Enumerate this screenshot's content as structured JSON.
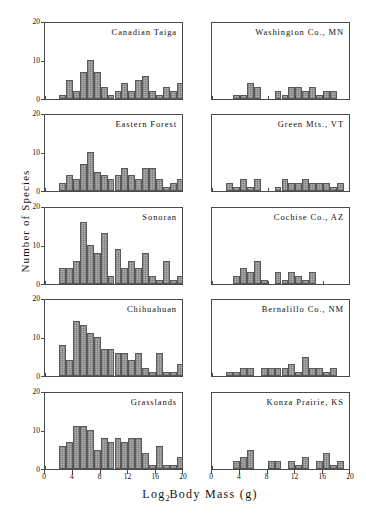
{
  "figure": {
    "xlabel_main": "Log",
    "xlabel_sub": "2",
    "xlabel_rest": "Body Mass (g)",
    "ylabel": "Number of Species",
    "xticks": [
      "0",
      "4",
      "8",
      "12",
      "16",
      "20"
    ],
    "yticks": [
      "0",
      "10",
      "20"
    ],
    "bar_fill": "#b3b3b3",
    "bar_edge": "#5a5a5a",
    "axis_color": "#4a4a4a"
  },
  "chart_data": [
    {
      "type": "bar",
      "title": "Canadian Taiga",
      "xlabel": "Log2 Body Mass (g)",
      "ylabel": "Number of Species",
      "xlim": [
        0,
        20
      ],
      "ylim": [
        0,
        20
      ],
      "grid": false,
      "bin_width": 1,
      "bin_starts": [
        2,
        3,
        4,
        5,
        6,
        7,
        8,
        9,
        10,
        11,
        12,
        13,
        14,
        15,
        16,
        17,
        18,
        19
      ],
      "values": [
        1,
        5,
        2,
        7,
        10,
        7,
        3,
        1,
        2,
        4,
        2,
        5,
        6,
        2,
        1,
        3,
        2,
        4
      ]
    },
    {
      "type": "bar",
      "title": "Washington Co., MN",
      "xlabel": "Log2 Body Mass (g)",
      "ylabel": "Number of Species",
      "xlim": [
        0,
        20
      ],
      "ylim": [
        0,
        20
      ],
      "grid": false,
      "bin_width": 1,
      "bin_starts": [
        3,
        4,
        5,
        6,
        9,
        10,
        11,
        12,
        13,
        14,
        15,
        16,
        17
      ],
      "values": [
        1,
        1,
        4,
        3,
        2,
        1,
        3,
        3,
        2,
        3,
        1,
        2,
        2
      ]
    },
    {
      "type": "bar",
      "title": "Eastern Forest",
      "xlabel": "Log2 Body Mass (g)",
      "ylabel": "Number of Species",
      "xlim": [
        0,
        20
      ],
      "ylim": [
        0,
        20
      ],
      "grid": false,
      "bin_width": 1,
      "bin_starts": [
        2,
        3,
        4,
        5,
        6,
        7,
        8,
        9,
        10,
        11,
        12,
        13,
        14,
        15,
        16,
        17,
        18,
        19
      ],
      "values": [
        2,
        4,
        3,
        7,
        10,
        5,
        4,
        3,
        4,
        6,
        4,
        3,
        6,
        6,
        3,
        1,
        2,
        3
      ]
    },
    {
      "type": "bar",
      "title": "Green Mts., VT",
      "xlabel": "Log2 Body Mass (g)",
      "ylabel": "Number of Species",
      "xlim": [
        0,
        20
      ],
      "ylim": [
        0,
        20
      ],
      "grid": false,
      "bin_width": 1,
      "bin_starts": [
        2,
        3,
        4,
        5,
        6,
        9,
        10,
        11,
        12,
        13,
        14,
        15,
        16,
        17,
        18
      ],
      "values": [
        2,
        1,
        3,
        1,
        3,
        1,
        3,
        2,
        2,
        3,
        2,
        2,
        2,
        1,
        2
      ]
    },
    {
      "type": "bar",
      "title": "Sonoran",
      "xlabel": "Log2 Body Mass (g)",
      "ylabel": "Number of Species",
      "xlim": [
        0,
        20
      ],
      "ylim": [
        0,
        20
      ],
      "grid": false,
      "bin_width": 1,
      "bin_starts": [
        2,
        3,
        4,
        5,
        6,
        7,
        8,
        9,
        10,
        11,
        12,
        13,
        14,
        15,
        16,
        17,
        18,
        19
      ],
      "values": [
        4,
        4,
        6,
        16,
        10,
        8,
        13,
        2,
        9,
        4,
        6,
        4,
        8,
        2,
        1,
        6,
        1,
        2
      ]
    },
    {
      "type": "bar",
      "title": "Cochise Co., AZ",
      "xlabel": "Log2 Body Mass (g)",
      "ylabel": "Number of Species",
      "xlim": [
        0,
        20
      ],
      "ylim": [
        0,
        20
      ],
      "grid": false,
      "bin_width": 1,
      "bin_starts": [
        3,
        4,
        5,
        6,
        7,
        9,
        10,
        11,
        12,
        13,
        14
      ],
      "values": [
        2,
        4,
        3,
        6,
        1,
        3,
        1,
        3,
        2,
        1,
        3
      ]
    },
    {
      "type": "bar",
      "title": "Chihuahuan",
      "xlabel": "Log2 Body Mass (g)",
      "ylabel": "Number of Species",
      "xlim": [
        0,
        20
      ],
      "ylim": [
        0,
        20
      ],
      "grid": false,
      "bin_width": 1,
      "bin_starts": [
        2,
        3,
        4,
        5,
        6,
        7,
        8,
        9,
        10,
        11,
        12,
        13,
        14,
        15,
        16,
        17,
        18,
        19
      ],
      "values": [
        8,
        4,
        14,
        13,
        11,
        10,
        7,
        7,
        6,
        6,
        4,
        6,
        2,
        1,
        6,
        1,
        1,
        3
      ]
    },
    {
      "type": "bar",
      "title": "Bernalillo Co., NM",
      "xlabel": "Log2 Body Mass (g)",
      "ylabel": "Number of Species",
      "xlim": [
        0,
        20
      ],
      "ylim": [
        0,
        20
      ],
      "grid": false,
      "bin_width": 1,
      "bin_starts": [
        2,
        3,
        4,
        5,
        7,
        8,
        9,
        10,
        11,
        12,
        13,
        14,
        15,
        16,
        17
      ],
      "values": [
        1,
        1,
        2,
        2,
        2,
        2,
        2,
        2,
        3,
        1,
        5,
        2,
        2,
        1,
        2
      ]
    },
    {
      "type": "bar",
      "title": "Grasslands",
      "xlabel": "Log2 Body Mass (g)",
      "ylabel": "Number of Species",
      "xlim": [
        0,
        20
      ],
      "ylim": [
        0,
        20
      ],
      "grid": false,
      "bin_width": 1,
      "bin_starts": [
        2,
        3,
        4,
        5,
        6,
        7,
        8,
        9,
        10,
        11,
        12,
        13,
        14,
        15,
        16,
        17,
        18,
        19
      ],
      "values": [
        6,
        7,
        11,
        11,
        10,
        5,
        8,
        7,
        8,
        7,
        8,
        8,
        4,
        1,
        6,
        1,
        1,
        3
      ]
    },
    {
      "type": "bar",
      "title": "Konza Prairie, KS",
      "xlabel": "Log2 Body Mass (g)",
      "ylabel": "Number of Species",
      "xlim": [
        0,
        20
      ],
      "ylim": [
        0,
        20
      ],
      "grid": false,
      "bin_width": 1,
      "bin_starts": [
        3,
        4,
        5,
        8,
        9,
        11,
        12,
        13,
        15,
        16,
        17,
        18
      ],
      "values": [
        2,
        3,
        5,
        2,
        2,
        2,
        1,
        3,
        2,
        4,
        1,
        2
      ]
    }
  ]
}
